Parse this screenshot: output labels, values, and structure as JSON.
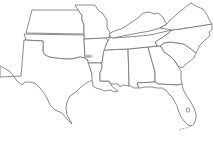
{
  "map": {
    "title": "Southern United States outline map",
    "background": "#ffffff",
    "stroke_color": "#6e6e6e",
    "states": [
      {
        "id": "texas",
        "name": "Texas"
      },
      {
        "id": "oklahoma",
        "name": "Oklahoma"
      },
      {
        "id": "kansas",
        "name": "Kansas"
      },
      {
        "id": "missouri",
        "name": "Missouri"
      },
      {
        "id": "arkansas",
        "name": "Arkansas"
      },
      {
        "id": "louisiana",
        "name": "Louisiana"
      },
      {
        "id": "mississippi",
        "name": "Mississippi"
      },
      {
        "id": "alabama",
        "name": "Alabama"
      },
      {
        "id": "georgia",
        "name": "Georgia"
      },
      {
        "id": "florida",
        "name": "Florida"
      },
      {
        "id": "south-carolina",
        "name": "South Carolina"
      },
      {
        "id": "north-carolina",
        "name": "North Carolina"
      },
      {
        "id": "tennessee",
        "name": "Tennessee"
      },
      {
        "id": "kentucky",
        "name": "Kentucky"
      },
      {
        "id": "virginia",
        "name": "Virginia"
      }
    ],
    "highlight_label": {
      "state": "Arkansas",
      "text": "ARK",
      "color": "#d8d8d8"
    }
  }
}
